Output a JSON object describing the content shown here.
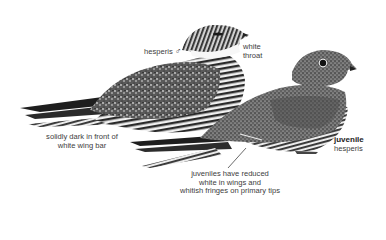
{
  "plate": {
    "subject": "Common Nighthawk (hesperis)",
    "birds": [
      {
        "name": "adult-male",
        "label": "hesperis",
        "sex_symbol": "♂"
      },
      {
        "name": "juvenile",
        "label_bold": "juvenile",
        "label_sub": "hesperis"
      }
    ]
  },
  "annotations": {
    "male_label": "hesperis",
    "male_symbol": "♂",
    "throat_line1": "white",
    "throat_line2": "throat",
    "wing_line1": "solidly dark in front of",
    "wing_line2": "white wing bar",
    "juvenile_title": "juvenile",
    "juvenile_sub": "hesperis",
    "juv_note_line1": "juveniles have reduced",
    "juv_note_line2": "white in wings and",
    "juv_note_line3": "whitish fringes on primary tips"
  },
  "colors": {
    "background": "#ffffff",
    "text": "#3d3d3d",
    "bird_dark": "#1e1e1e",
    "bird_mid": "#6b6b6b",
    "bird_light": "#d9d9d9"
  }
}
